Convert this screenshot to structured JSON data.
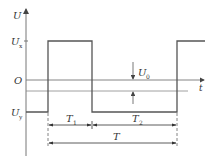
{
  "diagram": {
    "type": "rectangular pulse waveform",
    "axes": {
      "y_label": "U",
      "x_label": "t",
      "origin_label": "O"
    },
    "levels": {
      "high": {
        "label": "U",
        "sub": "x"
      },
      "low": {
        "label": "U",
        "sub": "y"
      },
      "offset": {
        "label": "U",
        "sub": "0"
      }
    },
    "intervals": {
      "t1": {
        "label": "T",
        "sub": "1"
      },
      "t2": {
        "label": "T",
        "sub": "2"
      },
      "period": {
        "label": "T"
      }
    },
    "colors": {
      "line": "#555555",
      "axis": "#777777",
      "text": "#333333"
    }
  }
}
